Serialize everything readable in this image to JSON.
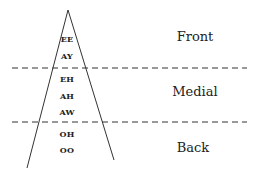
{
  "diagram": {
    "vowels": [
      {
        "label": "EE",
        "y": 35
      },
      {
        "label": "AY",
        "y": 53
      },
      {
        "label": "EH",
        "y": 76
      },
      {
        "label": "AH",
        "y": 93
      },
      {
        "label": "AW",
        "y": 109
      },
      {
        "label": "OH",
        "y": 130
      },
      {
        "label": "OO",
        "y": 147
      }
    ],
    "regions": [
      {
        "label": "Front",
        "y": 29
      },
      {
        "label": "Medial",
        "y": 86
      },
      {
        "label": "Back",
        "y": 140
      }
    ],
    "colors": {
      "line": "#333333",
      "text": "#222222"
    }
  }
}
